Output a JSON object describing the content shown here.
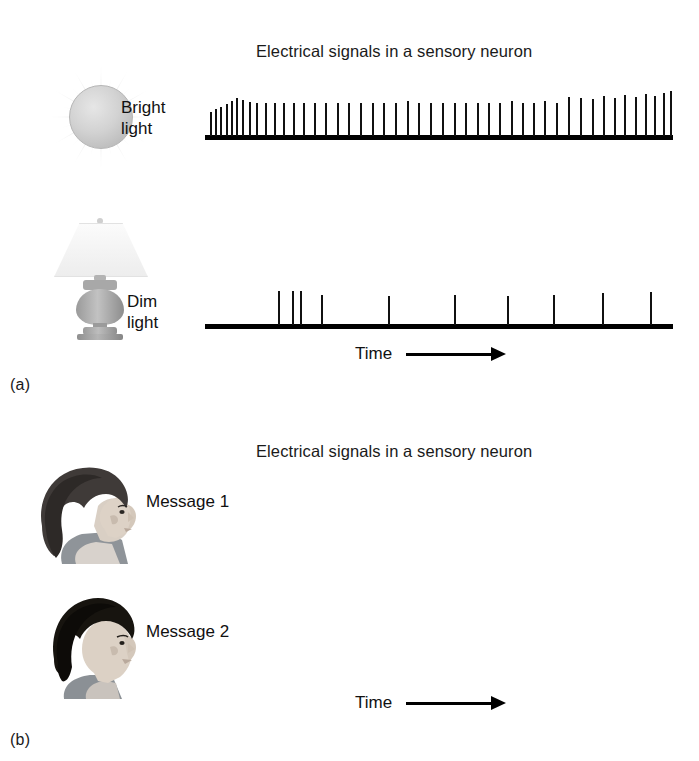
{
  "figure": {
    "panels": [
      {
        "id": "a",
        "label": "(a)",
        "title": "Electrical signals in a sensory neuron",
        "time_axis": {
          "label": "Time",
          "arrow": "right-arrow-icon"
        },
        "rows": [
          {
            "id": "bright-light",
            "label": "Bright\nlight",
            "icon": "sun-icon",
            "stimulus": "Bright light",
            "response_description": "High firing rate; densely packed action potentials that gradually spread apart over time"
          },
          {
            "id": "dim-light",
            "label": "Dim\nlight",
            "icon": "lamp-icon",
            "stimulus": "Dim light",
            "response_description": "Low firing rate; a brief early burst followed by widely spaced single action potentials"
          }
        ]
      },
      {
        "id": "b",
        "label": "(b)",
        "title": "Electrical signals in a sensory neuron",
        "time_axis": {
          "label": "Time",
          "arrow": "right-arrow-icon"
        },
        "rows": [
          {
            "id": "message-1",
            "label": "Message 1",
            "icon": "face-profile-woman-icon",
            "stimulus": "Message 1",
            "response_description": "Irregular train with two dense bursts separated by evenly spaced spikes"
          },
          {
            "id": "message-2",
            "label": "Message 2",
            "icon": "face-profile-man-icon",
            "stimulus": "Message 2",
            "response_description": "Clustered bursts of action potentials separated by long silent intervals"
          }
        ]
      }
    ]
  },
  "chart_data": {
    "type": "raster",
    "title": "Electrical signals in a sensory neuron",
    "xlabel": "Time",
    "ylabel": "",
    "grid": false,
    "legend": "none",
    "xlim": [
      0,
      100
    ],
    "series": [
      {
        "name": "Bright light",
        "panel": "a",
        "spike_count": 47,
        "spikes": [
          {
            "x": 1.0,
            "h": 52
          },
          {
            "x": 2.2,
            "h": 58
          },
          {
            "x": 3.3,
            "h": 62
          },
          {
            "x": 4.4,
            "h": 68
          },
          {
            "x": 5.5,
            "h": 74
          },
          {
            "x": 6.7,
            "h": 80
          },
          {
            "x": 8.0,
            "h": 76
          },
          {
            "x": 9.4,
            "h": 72
          },
          {
            "x": 11.0,
            "h": 70
          },
          {
            "x": 12.8,
            "h": 70
          },
          {
            "x": 14.7,
            "h": 70
          },
          {
            "x": 16.7,
            "h": 70
          },
          {
            "x": 18.8,
            "h": 70
          },
          {
            "x": 21.0,
            "h": 70
          },
          {
            "x": 23.3,
            "h": 70
          },
          {
            "x": 25.7,
            "h": 70
          },
          {
            "x": 28.1,
            "h": 70
          },
          {
            "x": 30.6,
            "h": 70
          },
          {
            "x": 33.1,
            "h": 70
          },
          {
            "x": 35.6,
            "h": 70
          },
          {
            "x": 38.1,
            "h": 70
          },
          {
            "x": 40.6,
            "h": 70
          },
          {
            "x": 43.1,
            "h": 74
          },
          {
            "x": 45.6,
            "h": 70
          },
          {
            "x": 48.1,
            "h": 70
          },
          {
            "x": 50.6,
            "h": 70
          },
          {
            "x": 53.1,
            "h": 70
          },
          {
            "x": 55.6,
            "h": 70
          },
          {
            "x": 58.1,
            "h": 70
          },
          {
            "x": 60.5,
            "h": 70
          },
          {
            "x": 62.9,
            "h": 70
          },
          {
            "x": 65.3,
            "h": 74
          },
          {
            "x": 67.7,
            "h": 70
          },
          {
            "x": 70.1,
            "h": 70
          },
          {
            "x": 72.5,
            "h": 74
          },
          {
            "x": 75.0,
            "h": 70
          },
          {
            "x": 77.6,
            "h": 84
          },
          {
            "x": 80.2,
            "h": 80
          },
          {
            "x": 82.6,
            "h": 78
          },
          {
            "x": 85.0,
            "h": 86
          },
          {
            "x": 87.4,
            "h": 80
          },
          {
            "x": 89.6,
            "h": 88
          },
          {
            "x": 91.8,
            "h": 84
          },
          {
            "x": 94.0,
            "h": 90
          },
          {
            "x": 96.0,
            "h": 86
          },
          {
            "x": 97.8,
            "h": 92
          },
          {
            "x": 99.3,
            "h": 96
          }
        ]
      },
      {
        "name": "Dim light",
        "panel": "a",
        "spike_count": 10,
        "spikes": [
          {
            "x": 15.5,
            "h": 82
          },
          {
            "x": 18.6,
            "h": 82
          },
          {
            "x": 20.3,
            "h": 82
          },
          {
            "x": 24.8,
            "h": 74
          },
          {
            "x": 39.2,
            "h": 70
          },
          {
            "x": 53.2,
            "h": 74
          },
          {
            "x": 64.5,
            "h": 70
          },
          {
            "x": 74.3,
            "h": 74
          },
          {
            "x": 84.9,
            "h": 78
          },
          {
            "x": 95.0,
            "h": 80
          }
        ]
      },
      {
        "name": "Message 1",
        "panel": "b",
        "spike_count": 63,
        "spikes": [
          {
            "x": 1.5,
            "h": 76
          },
          {
            "x": 7.2,
            "h": 76
          },
          {
            "x": 11.8,
            "h": 76
          },
          {
            "x": 15.4,
            "h": 80
          },
          {
            "x": 17.9,
            "h": 80
          },
          {
            "x": 20.2,
            "h": 80
          },
          {
            "x": 22.4,
            "h": 80
          },
          {
            "x": 24.4,
            "h": 80
          },
          {
            "x": 26.4,
            "h": 84
          },
          {
            "x": 28.2,
            "h": 84
          },
          {
            "x": 29.8,
            "h": 84
          },
          {
            "x": 31.3,
            "h": 84
          },
          {
            "x": 32.6,
            "h": 88
          },
          {
            "x": 33.8,
            "h": 88
          },
          {
            "x": 34.8,
            "h": 88
          },
          {
            "x": 35.7,
            "h": 88
          },
          {
            "x": 36.5,
            "h": 88
          },
          {
            "x": 37.3,
            "h": 88
          },
          {
            "x": 38.2,
            "h": 86
          },
          {
            "x": 39.3,
            "h": 86
          },
          {
            "x": 40.6,
            "h": 84
          },
          {
            "x": 42.1,
            "h": 84
          },
          {
            "x": 43.8,
            "h": 82
          },
          {
            "x": 45.7,
            "h": 82
          },
          {
            "x": 48.0,
            "h": 80
          },
          {
            "x": 50.3,
            "h": 80
          },
          {
            "x": 52.6,
            "h": 80
          },
          {
            "x": 54.9,
            "h": 80
          },
          {
            "x": 57.2,
            "h": 78
          },
          {
            "x": 59.6,
            "h": 78
          },
          {
            "x": 62.4,
            "h": 78
          },
          {
            "x": 65.6,
            "h": 78
          },
          {
            "x": 68.8,
            "h": 76
          },
          {
            "x": 72.0,
            "h": 76
          },
          {
            "x": 75.6,
            "h": 80
          },
          {
            "x": 78.4,
            "h": 80
          },
          {
            "x": 80.6,
            "h": 80
          },
          {
            "x": 82.6,
            "h": 82
          },
          {
            "x": 84.4,
            "h": 82
          },
          {
            "x": 86.0,
            "h": 84
          },
          {
            "x": 87.4,
            "h": 84
          },
          {
            "x": 88.6,
            "h": 86
          },
          {
            "x": 89.6,
            "h": 86
          },
          {
            "x": 90.5,
            "h": 86
          },
          {
            "x": 91.3,
            "h": 88
          },
          {
            "x": 92.0,
            "h": 88
          },
          {
            "x": 92.7,
            "h": 88
          },
          {
            "x": 93.4,
            "h": 88
          },
          {
            "x": 94.1,
            "h": 88
          },
          {
            "x": 94.9,
            "h": 86
          },
          {
            "x": 95.8,
            "h": 86
          },
          {
            "x": 96.8,
            "h": 84
          },
          {
            "x": 97.9,
            "h": 84
          },
          {
            "x": 99.2,
            "h": 86
          }
        ]
      },
      {
        "name": "Message 2",
        "panel": "b",
        "spike_count": 30,
        "spikes": [
          {
            "x": 1.2,
            "h": 80
          },
          {
            "x": 2.8,
            "h": 84
          },
          {
            "x": 4.4,
            "h": 84
          },
          {
            "x": 6.0,
            "h": 82
          },
          {
            "x": 7.8,
            "h": 84
          },
          {
            "x": 9.6,
            "h": 80
          },
          {
            "x": 14.2,
            "h": 80
          },
          {
            "x": 16.2,
            "h": 82
          },
          {
            "x": 32.0,
            "h": 84
          },
          {
            "x": 33.6,
            "h": 84
          },
          {
            "x": 35.2,
            "h": 84
          },
          {
            "x": 36.8,
            "h": 82
          },
          {
            "x": 39.8,
            "h": 82
          },
          {
            "x": 42.0,
            "h": 80
          },
          {
            "x": 45.8,
            "h": 82
          },
          {
            "x": 48.0,
            "h": 80
          },
          {
            "x": 52.2,
            "h": 80
          },
          {
            "x": 56.4,
            "h": 80
          },
          {
            "x": 68.0,
            "h": 80
          },
          {
            "x": 69.8,
            "h": 80
          },
          {
            "x": 73.4,
            "h": 78
          },
          {
            "x": 84.0,
            "h": 80
          },
          {
            "x": 85.8,
            "h": 80
          },
          {
            "x": 89.2,
            "h": 78
          },
          {
            "x": 93.0,
            "h": 80
          },
          {
            "x": 94.6,
            "h": 80
          },
          {
            "x": 96.2,
            "h": 80
          },
          {
            "x": 99.0,
            "h": 80
          }
        ]
      }
    ]
  }
}
